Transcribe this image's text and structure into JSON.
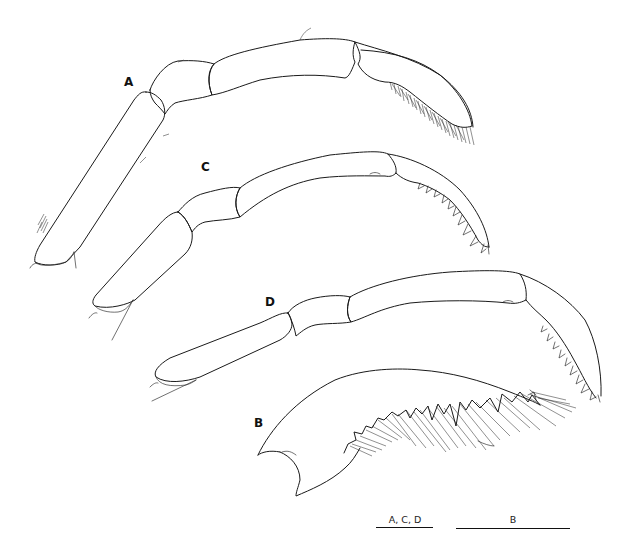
{
  "figure": {
    "panels": [
      {
        "id": "A",
        "label": "A"
      },
      {
        "id": "B",
        "label": "B"
      },
      {
        "id": "C",
        "label": "C"
      },
      {
        "id": "D",
        "label": "D"
      }
    ],
    "scale_bars": [
      {
        "label": "A, C, D"
      },
      {
        "label": "B"
      }
    ],
    "colors": {
      "background": "#ffffff",
      "line": "#1a1a1a"
    }
  }
}
